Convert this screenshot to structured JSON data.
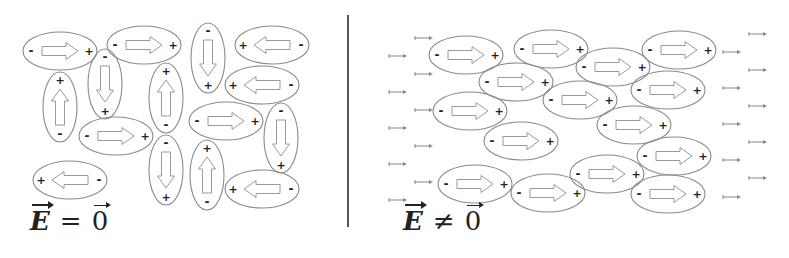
{
  "colors": {
    "outline": "#8a8a8a",
    "arrow": "#9a9a9a",
    "sign": "#222222",
    "divider": "#555555",
    "field_arrow": "#888888",
    "background": "#ffffff"
  },
  "left_panel": {
    "label": {
      "vector": "E",
      "operator": "=",
      "rhs": "0"
    },
    "caption": "E = 0",
    "dipoles": [
      {
        "cx": 60,
        "cy": 51,
        "orient": "h",
        "dir": "right"
      },
      {
        "cx": 144,
        "cy": 45,
        "orient": "h",
        "dir": "right"
      },
      {
        "cx": 105,
        "cy": 84,
        "orient": "v",
        "dir": "down"
      },
      {
        "cx": 60,
        "cy": 107,
        "orient": "v",
        "dir": "up"
      },
      {
        "cx": 166,
        "cy": 98,
        "orient": "v",
        "dir": "up"
      },
      {
        "cx": 208,
        "cy": 58,
        "orient": "v",
        "dir": "down"
      },
      {
        "cx": 272,
        "cy": 45,
        "orient": "h",
        "dir": "left"
      },
      {
        "cx": 262,
        "cy": 85,
        "orient": "h",
        "dir": "left"
      },
      {
        "cx": 116,
        "cy": 136,
        "orient": "h",
        "dir": "right"
      },
      {
        "cx": 226,
        "cy": 121,
        "orient": "h",
        "dir": "right"
      },
      {
        "cx": 281,
        "cy": 138,
        "orient": "v",
        "dir": "down"
      },
      {
        "cx": 166,
        "cy": 170,
        "orient": "v",
        "dir": "down"
      },
      {
        "cx": 207,
        "cy": 175,
        "orient": "v",
        "dir": "up"
      },
      {
        "cx": 70,
        "cy": 180,
        "orient": "h",
        "dir": "left"
      },
      {
        "cx": 262,
        "cy": 189,
        "orient": "h",
        "dir": "left"
      }
    ]
  },
  "right_panel": {
    "label": {
      "vector": "E",
      "operator": "≠",
      "rhs": "0"
    },
    "caption": "E ≠ 0",
    "dipoles": [
      {
        "cx": 466,
        "cy": 55,
        "orient": "h",
        "dir": "right"
      },
      {
        "cx": 551,
        "cy": 49,
        "orient": "h",
        "dir": "right"
      },
      {
        "cx": 613,
        "cy": 67,
        "orient": "h",
        "dir": "right"
      },
      {
        "cx": 679,
        "cy": 50,
        "orient": "h",
        "dir": "right"
      },
      {
        "cx": 516,
        "cy": 82,
        "orient": "h",
        "dir": "right"
      },
      {
        "cx": 580,
        "cy": 100,
        "orient": "h",
        "dir": "right"
      },
      {
        "cx": 668,
        "cy": 90,
        "orient": "h",
        "dir": "right"
      },
      {
        "cx": 470,
        "cy": 111,
        "orient": "h",
        "dir": "right"
      },
      {
        "cx": 634,
        "cy": 125,
        "orient": "h",
        "dir": "right"
      },
      {
        "cx": 521,
        "cy": 141,
        "orient": "h",
        "dir": "right"
      },
      {
        "cx": 674,
        "cy": 156,
        "orient": "h",
        "dir": "right"
      },
      {
        "cx": 607,
        "cy": 174,
        "orient": "h",
        "dir": "right"
      },
      {
        "cx": 475,
        "cy": 184,
        "orient": "h",
        "dir": "right"
      },
      {
        "cx": 548,
        "cy": 193,
        "orient": "h",
        "dir": "right"
      },
      {
        "cx": 668,
        "cy": 194,
        "orient": "h",
        "dir": "right"
      }
    ],
    "field_arrows": [
      {
        "x": 415,
        "y": 38
      },
      {
        "x": 389,
        "y": 56
      },
      {
        "x": 415,
        "y": 74
      },
      {
        "x": 389,
        "y": 92
      },
      {
        "x": 415,
        "y": 110
      },
      {
        "x": 389,
        "y": 128
      },
      {
        "x": 415,
        "y": 146
      },
      {
        "x": 389,
        "y": 164
      },
      {
        "x": 415,
        "y": 182
      },
      {
        "x": 389,
        "y": 200
      },
      {
        "x": 749,
        "y": 34
      },
      {
        "x": 723,
        "y": 52
      },
      {
        "x": 749,
        "y": 70
      },
      {
        "x": 723,
        "y": 88
      },
      {
        "x": 749,
        "y": 106
      },
      {
        "x": 723,
        "y": 124
      },
      {
        "x": 749,
        "y": 142
      },
      {
        "x": 723,
        "y": 160
      },
      {
        "x": 749,
        "y": 178
      },
      {
        "x": 723,
        "y": 197
      }
    ]
  },
  "signs": {
    "plus": "+",
    "minus": "-"
  },
  "divider": {
    "x": 348,
    "y1": 15,
    "y2": 227
  }
}
